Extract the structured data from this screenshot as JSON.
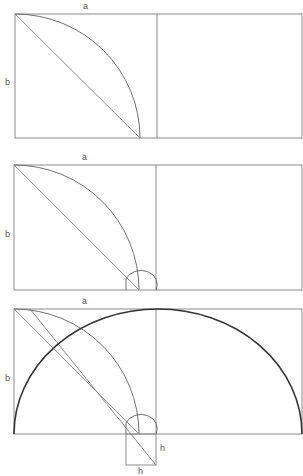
{
  "figure": {
    "panels": [
      {
        "label_top": "a",
        "label_left": "b"
      },
      {
        "label_top": "a",
        "label_left": "b"
      },
      {
        "label_top": "a",
        "label_left": "b",
        "label_h_right": "h",
        "label_h_bottom": "h"
      }
    ]
  },
  "colors": {
    "line": "#8a8a8a",
    "arc": "#777777",
    "big_arc": "#333333"
  }
}
